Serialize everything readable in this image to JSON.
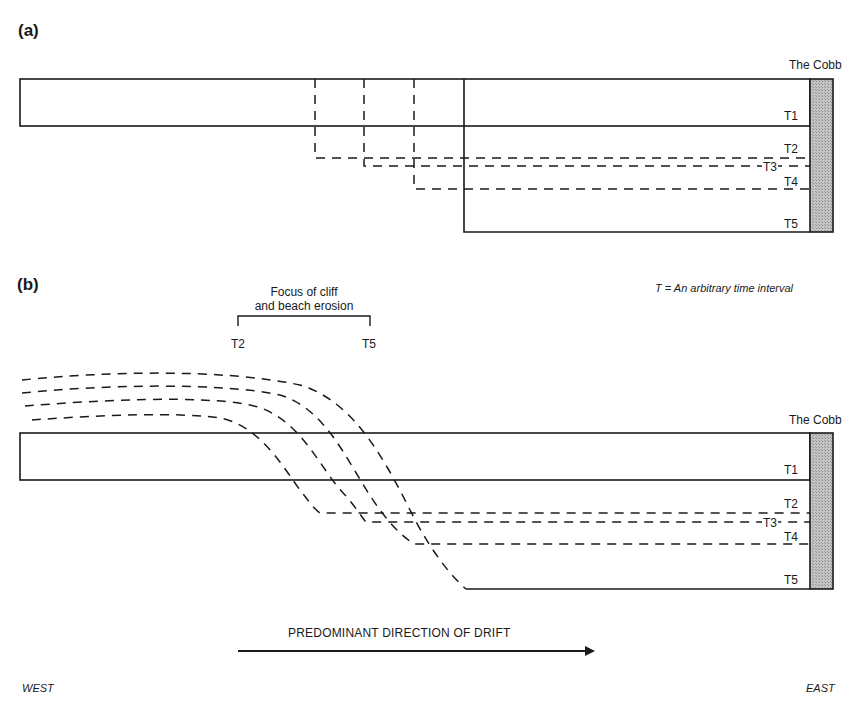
{
  "figure": {
    "panels": [
      {
        "id": "a",
        "label": "(a)",
        "landmark": "The Cobb",
        "time_labels": [
          "T1",
          "T2",
          "T3",
          "T4",
          "T5"
        ]
      },
      {
        "id": "b",
        "label": "(b)",
        "landmark": "The Cobb",
        "time_labels": [
          "T1",
          "T2",
          "T3",
          "T4",
          "T5"
        ],
        "focus_annotation": {
          "line1": "Focus of cliff",
          "line2": "and beach erosion",
          "left_label": "T2",
          "right_label": "T5"
        }
      }
    ],
    "legend_note": "T = An arbitrary time interval",
    "drift_label": "PREDOMINANT DIRECTION OF DRIFT",
    "west_label": "WEST",
    "east_label": "EAST",
    "colors": {
      "line": "#1a1a1a",
      "cobb_fill": "#b8b8b8",
      "background": "#ffffff"
    }
  }
}
